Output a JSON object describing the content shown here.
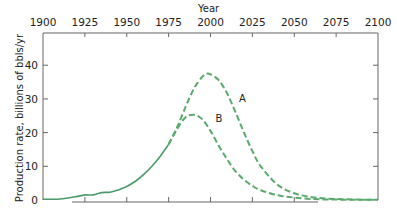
{
  "chart_data": {
    "type": "line",
    "title": "",
    "xlabel": "Year",
    "ylabel": "Production rate, billions of bbls/yr",
    "xlim": [
      1900,
      2100
    ],
    "ylim": [
      0,
      48
    ],
    "x_ticks": [
      1900,
      1925,
      1950,
      1975,
      2000,
      2025,
      2050,
      2075,
      2100
    ],
    "y_ticks": [
      0,
      10,
      20,
      30,
      40
    ],
    "x_axis_position": "top",
    "grid": false,
    "legend": "inline labels",
    "series": [
      {
        "name": "Historical",
        "style": "solid",
        "color": "#4a9a6a",
        "x": [
          1900,
          1910,
          1920,
          1925,
          1930,
          1935,
          1940,
          1945,
          1950,
          1955,
          1960,
          1965,
          1970,
          1975
        ],
        "values": [
          0.2,
          0.3,
          1.0,
          1.5,
          1.5,
          2.2,
          2.3,
          3.0,
          4.0,
          5.5,
          7.5,
          10.0,
          13.0,
          16.5
        ]
      },
      {
        "name": "A",
        "style": "dashed",
        "color": "#5aaa6e",
        "x": [
          1975,
          1980,
          1985,
          1990,
          1995,
          1998,
          2000,
          2005,
          2010,
          2015,
          2020,
          2025,
          2030,
          2040,
          2050,
          2060,
          2070,
          2080,
          2090,
          2100
        ],
        "values": [
          16.5,
          21.5,
          27.5,
          33.0,
          36.5,
          37.5,
          37.3,
          35.5,
          31.5,
          26.0,
          20.0,
          14.5,
          10.0,
          4.5,
          2.0,
          0.9,
          0.4,
          0.2,
          0.1,
          0.1
        ]
      },
      {
        "name": "B",
        "style": "dashed",
        "color": "#5aaa6e",
        "x": [
          1975,
          1980,
          1985,
          1990,
          1995,
          2000,
          2005,
          2010,
          2015,
          2020,
          2025,
          2030,
          2040,
          2050,
          2060,
          2070,
          2080,
          2090,
          2100
        ],
        "values": [
          16.5,
          21.0,
          24.5,
          25.3,
          24.0,
          20.5,
          16.0,
          12.0,
          8.5,
          6.0,
          4.2,
          2.9,
          1.4,
          0.7,
          0.3,
          0.15,
          0.1,
          0.1,
          0.1
        ]
      }
    ],
    "annotations": [
      {
        "text": "A",
        "x": 2017,
        "y": 29
      },
      {
        "text": "B",
        "x": 2003,
        "y": 23
      }
    ]
  },
  "labels": {
    "x_title": "Year",
    "y_title": "Production rate, billions of bbls/yr",
    "series_a": "A",
    "series_b": "B"
  }
}
